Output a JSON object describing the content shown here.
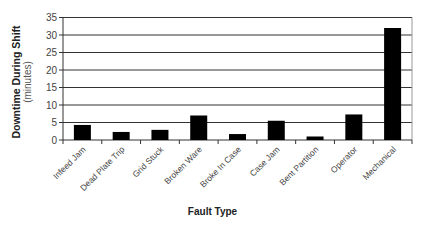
{
  "chart_data": {
    "type": "bar",
    "title": "",
    "xlabel": "Fault Type",
    "ylabel": "Downtime During Shift",
    "ylabel_sub": "(minutes)",
    "categories": [
      "Infeed Jam",
      "Dead Plate Trip",
      "Grid Stuck",
      "Broken Ware",
      "Broke In Case",
      "Case Jam",
      "Bent Partition",
      "Operator",
      "Mechanical"
    ],
    "values": [
      4.3,
      2.3,
      2.9,
      7.0,
      1.7,
      5.5,
      1.0,
      7.3,
      32.0
    ],
    "ylim": [
      0,
      35
    ],
    "yticks": [
      0,
      5,
      10,
      15,
      20,
      25,
      30,
      35
    ],
    "grid": true,
    "legend": null,
    "bar_color": "#000000",
    "grid_color": "#333333"
  }
}
